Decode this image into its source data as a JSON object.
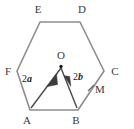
{
  "figure": {
    "type": "geometry-diagram",
    "shape": "regular-hexagon",
    "title": "",
    "colors": {
      "hexagon_stroke": "#8d8d8d",
      "vector_stroke": "#4a4a4a",
      "label_text": "#3a3a3a",
      "vector_label_text": "#1c1c1c",
      "background": "#ffffff",
      "center_dot": "#1c1c1c"
    },
    "vertices": [
      {
        "name": "A",
        "label": "A",
        "x": 30,
        "y": 110,
        "label_x": 27,
        "label_y": 123
      },
      {
        "name": "B",
        "label": "B",
        "x": 78,
        "y": 110,
        "label_x": 75,
        "label_y": 123
      },
      {
        "name": "C",
        "label": "C",
        "x": 104,
        "y": 71,
        "label_x": 110,
        "label_y": 74
      },
      {
        "name": "D",
        "label": "D",
        "x": 80,
        "y": 22,
        "label_x": 77,
        "label_y": 15
      },
      {
        "name": "E",
        "label": "E",
        "x": 40,
        "y": 22,
        "label_x": 36,
        "label_y": 15
      },
      {
        "name": "F",
        "label": "F",
        "x": 17,
        "y": 71,
        "label_x": 6,
        "label_y": 74
      }
    ],
    "points": [
      {
        "name": "O",
        "label": "O",
        "x": 61,
        "y": 66,
        "label_x": 58,
        "label_y": 59,
        "dot": true
      },
      {
        "name": "M",
        "label": "M",
        "x": 91,
        "y": 90,
        "label_x": 97,
        "label_y": 92,
        "dot": false,
        "tick": true
      }
    ],
    "vectors": [
      {
        "name": "vector-2a",
        "label": "2a",
        "label_prefix": "2",
        "label_symbol": "a",
        "from": "O",
        "to": "A",
        "x1": 61,
        "y1": 68,
        "x2": 31,
        "y2": 108,
        "label_x": 24,
        "label_y": 81
      },
      {
        "name": "vector-2b",
        "label": "2b",
        "label_prefix": "2",
        "label_symbol": "b",
        "from": "O",
        "to": "B",
        "x1": 61,
        "y1": 68,
        "x2": 77,
        "y2": 108,
        "label_x": 75,
        "label_y": 79
      }
    ],
    "edges": [
      {
        "name": "edge-AB",
        "from": "A",
        "to": "B"
      },
      {
        "name": "edge-BC",
        "from": "B",
        "to": "C"
      },
      {
        "name": "edge-CD",
        "from": "C",
        "to": "D"
      },
      {
        "name": "edge-DE",
        "from": "D",
        "to": "E"
      },
      {
        "name": "edge-EF",
        "from": "E",
        "to": "F"
      },
      {
        "name": "edge-FA",
        "from": "F",
        "to": "A"
      }
    ]
  }
}
